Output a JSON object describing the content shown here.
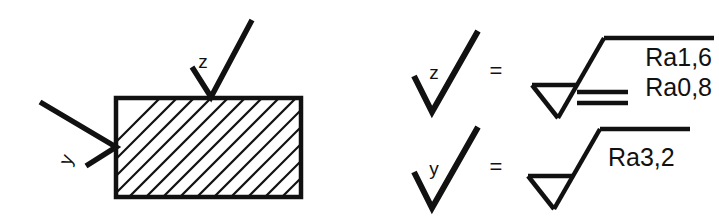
{
  "figure": {
    "background_color": "#ffffff",
    "line_color": "#111111"
  },
  "part_view": {
    "name": "hatched-section-block",
    "block": {
      "x": 115,
      "y": 97,
      "width": 187,
      "height": 101
    },
    "hatch": {
      "angle_deg": 45,
      "spacing": 17,
      "line_width": 2.2
    },
    "leaders": [
      {
        "name": "z-leader",
        "label": "z",
        "label_x": 211,
        "label_y": 63,
        "target_face": "top"
      },
      {
        "name": "y-leader",
        "label": "y",
        "label_x": 70,
        "label_y": 156,
        "target_face": "left"
      }
    ]
  },
  "legend": {
    "rows": [
      {
        "name": "legend-row-z",
        "symbol_label": "z",
        "equals": "=",
        "roughness_values": [
          "Ra1,6",
          "Ra0,8"
        ],
        "has_double_bar": true
      },
      {
        "name": "legend-row-y",
        "symbol_label": "y",
        "equals": "=",
        "roughness_values": [
          "Ra3,2"
        ],
        "has_double_bar": false
      }
    ]
  }
}
